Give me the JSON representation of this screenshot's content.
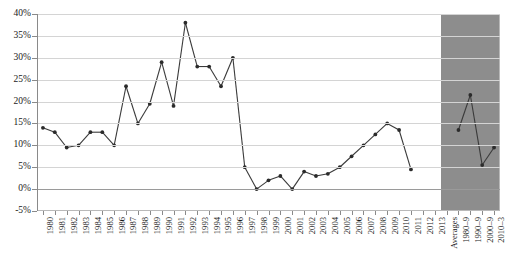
{
  "chart_data": {
    "type": "line",
    "title": "",
    "subtitle": "",
    "xlabel": "",
    "ylabel": "",
    "ylim": [
      -5,
      40
    ],
    "ytick_step": 5,
    "ytick_labels": [
      "40%",
      "35%",
      "30%",
      "25%",
      "20%",
      "15%",
      "10%",
      "5%",
      "0%",
      "-5%"
    ],
    "ytick_values": [
      40,
      35,
      30,
      25,
      20,
      15,
      10,
      5,
      0,
      -5
    ],
    "grid": true,
    "legend": "none",
    "marker": "filled-circle",
    "line_color": "#3a3a3a",
    "marker_color": "#2b2b2b",
    "grid_color": "#d4d4d4",
    "shaded_panel_color": "#8d8d8d",
    "categories": [
      "1980",
      "1981",
      "1982",
      "1983",
      "1984",
      "1985",
      "1986",
      "1987",
      "1988",
      "1989",
      "1990",
      "1991",
      "1992",
      "1993",
      "1994",
      "1995",
      "1996",
      "1997",
      "1998",
      "1999",
      "2000",
      "2001",
      "2002",
      "2003",
      "2004",
      "2005",
      "2006",
      "2007",
      "2008",
      "2009",
      "2010",
      "2011",
      "2012",
      "2013"
    ],
    "values": [
      14.0,
      13.0,
      9.5,
      10.0,
      13.0,
      13.0,
      10.0,
      23.5,
      15.0,
      19.5,
      29.0,
      19.0,
      38.0,
      28.0,
      28.0,
      23.5,
      30.0,
      5.0,
      0.0,
      2.0,
      3.0,
      0.0,
      4.0,
      3.0,
      3.5,
      5.0,
      7.5,
      10.0,
      12.5,
      15.0,
      13.5,
      4.5,
      null,
      null
    ],
    "series": [
      {
        "name": "annual",
        "values": [
          14.0,
          13.0,
          9.5,
          10.0,
          13.0,
          13.0,
          10.0,
          23.5,
          15.0,
          19.5,
          29.0,
          19.0,
          38.0,
          28.0,
          28.0,
          23.5,
          30.0,
          5.0,
          0.0,
          2.0,
          3.0,
          0.0,
          4.0,
          3.0,
          3.5,
          5.0,
          7.5,
          10.0,
          12.5,
          15.0,
          13.5,
          4.5,
          null,
          null
        ]
      }
    ],
    "averages_panel": {
      "header_label": "Averages",
      "categories": [
        "1980–9",
        "1990–9",
        "2000–9",
        "2010–3"
      ],
      "values": [
        13.5,
        21.5,
        5.5,
        9.5
      ]
    }
  }
}
